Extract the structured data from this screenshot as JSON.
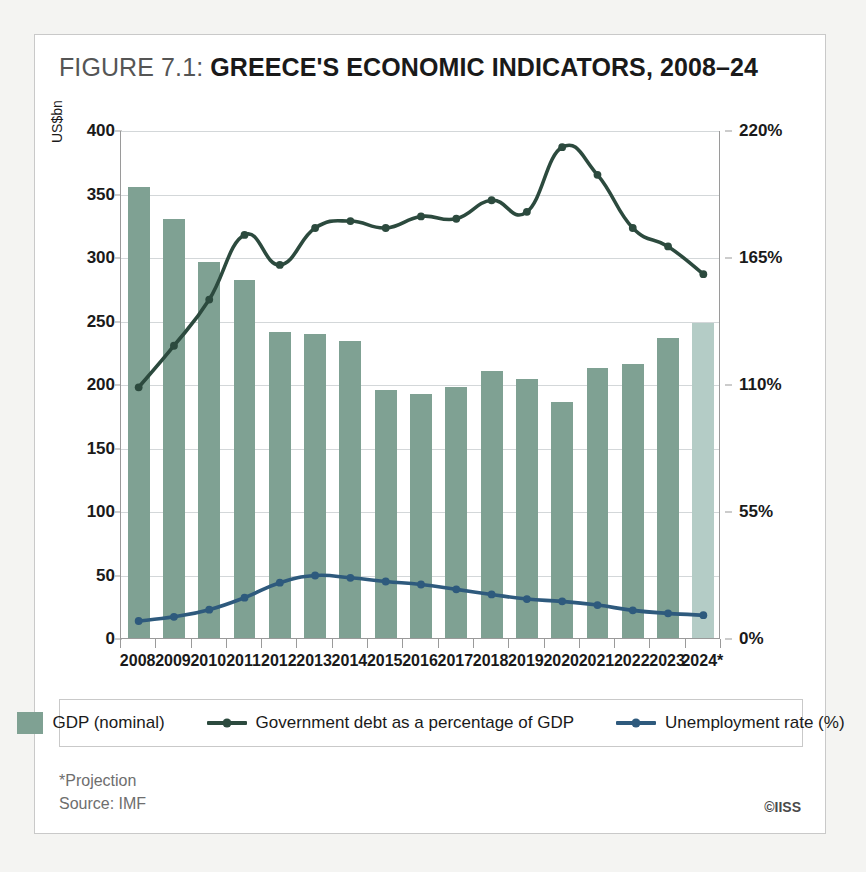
{
  "figure": {
    "label": "FIGURE 7.1:",
    "title": "GREECE'S ECONOMIC INDICATORS, 2008–24"
  },
  "footer": {
    "projection_note": "*Projection",
    "source": "Source: IMF",
    "copyright": "©IISS"
  },
  "legend": {
    "position": "bottom",
    "items": [
      {
        "label": "GDP (nominal)",
        "marker": "swatch",
        "color": "#7fa193"
      },
      {
        "label": "Government debt as a percentage of GDP",
        "marker": "line-dot",
        "color": "#2c4a3e"
      },
      {
        "label": "Unemployment rate (%)",
        "marker": "line-dot",
        "color": "#2e5a7d"
      }
    ]
  },
  "colors": {
    "bar": "#7fa193",
    "bar_projection": "#b4ccc6",
    "debt_line": "#2c4a3e",
    "unemployment_line": "#2e5a7d",
    "grid": "#d3d7d9",
    "axis": "#9a9a9a",
    "card_border": "#c9c9c9",
    "page_background": "#f4f4f2"
  },
  "chart_data": {
    "type": "bar",
    "title": "GREECE'S ECONOMIC INDICATORS, 2008–24",
    "xlabel": "",
    "ylabel": "US$bn",
    "y2label": "",
    "grid": true,
    "categories": [
      "2008",
      "2009",
      "2010",
      "2011",
      "2012",
      "2013",
      "2014",
      "2015",
      "2016",
      "2017",
      "2018",
      "2019",
      "2020",
      "2021",
      "2022",
      "2023",
      "2024*"
    ],
    "left_axis": {
      "label": "US$bn",
      "ylim": [
        0,
        400
      ],
      "ticks": [
        0,
        50,
        100,
        150,
        200,
        250,
        300,
        350,
        400
      ],
      "tick_labels": [
        "0",
        "50",
        "100",
        "150",
        "200",
        "250",
        "300",
        "350",
        "400"
      ]
    },
    "right_axis": {
      "label": "",
      "ylim": [
        0,
        220
      ],
      "ticks": [
        0,
        55,
        110,
        165,
        220
      ],
      "tick_labels": [
        "0%",
        "55%",
        "110%",
        "165%",
        "220%"
      ]
    },
    "series": [
      {
        "name": "GDP (nominal)",
        "type": "bar",
        "axis": "left",
        "unit": "US$bn",
        "color": "#7fa193",
        "projection_color": "#b4ccc6",
        "projection_indices": [
          16
        ],
        "values": [
          355,
          330,
          296,
          282,
          241,
          239,
          234,
          195,
          192,
          198,
          210,
          204,
          186,
          213,
          216,
          236,
          248
        ]
      },
      {
        "name": "Government debt as a percentage of GDP",
        "type": "line",
        "axis": "right",
        "unit": "%",
        "color": "#2c4a3e",
        "values": [
          109,
          127,
          147,
          175,
          162,
          178,
          181,
          178,
          183,
          182,
          190,
          185,
          213,
          201,
          178,
          170,
          158
        ]
      },
      {
        "name": "Unemployment rate (%)",
        "type": "line",
        "axis": "right",
        "unit": "%",
        "color": "#2e5a7d",
        "values": [
          7.8,
          9.6,
          12.7,
          17.9,
          24.4,
          27.5,
          26.5,
          24.9,
          23.6,
          21.5,
          19.3,
          17.3,
          16.3,
          14.7,
          12.4,
          11.1,
          10.3
        ]
      }
    ]
  }
}
